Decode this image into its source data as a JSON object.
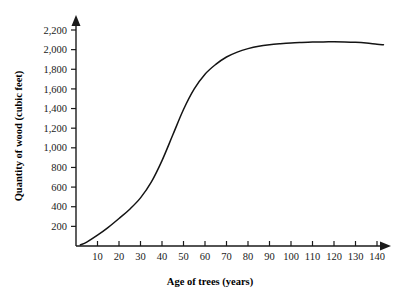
{
  "chart_data": {
    "type": "line",
    "title": "",
    "xlabel": "Age of trees (years)",
    "ylabel": "Quantity of wood (cubic feet)",
    "xlim": [
      0,
      145
    ],
    "ylim": [
      0,
      2300
    ],
    "grid": false,
    "legend": false,
    "line_color": "#141414",
    "background_color": "#ffffff",
    "xticks": [
      10,
      20,
      30,
      40,
      50,
      60,
      70,
      80,
      90,
      100,
      110,
      120,
      130,
      140
    ],
    "xtick_labels": [
      "10",
      "20",
      "30",
      "40",
      "50",
      "60",
      "70",
      "80",
      "90",
      "100",
      "110",
      "120",
      "130",
      "140"
    ],
    "yticks": [
      200,
      400,
      600,
      800,
      1000,
      1200,
      1400,
      1600,
      1800,
      2000,
      2200
    ],
    "ytick_labels": [
      "200",
      "400",
      "600",
      "800",
      "1,000",
      "1,200",
      "1,400",
      "1,600",
      "1,800",
      "2,000",
      "2,200"
    ],
    "series": [
      {
        "name": "Quantity of wood",
        "x": [
          2,
          5,
          10,
          15,
          20,
          25,
          30,
          35,
          40,
          45,
          50,
          55,
          60,
          65,
          70,
          75,
          80,
          85,
          90,
          95,
          100,
          105,
          110,
          115,
          120,
          125,
          130,
          135,
          140,
          143
        ],
        "y": [
          10,
          40,
          110,
          190,
          280,
          375,
          490,
          650,
          870,
          1130,
          1390,
          1600,
          1750,
          1850,
          1925,
          1975,
          2010,
          2035,
          2050,
          2060,
          2068,
          2073,
          2077,
          2079,
          2080,
          2079,
          2075,
          2067,
          2055,
          2050
        ]
      }
    ]
  },
  "axes": {
    "x_arrow": "arrow-right",
    "y_arrow": "arrow-up"
  }
}
